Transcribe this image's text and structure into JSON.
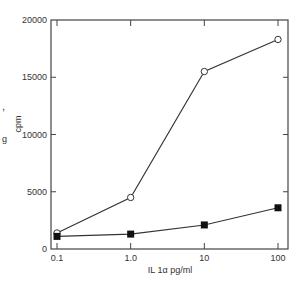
{
  "chart_data": {
    "type": "line",
    "title": "",
    "xlabel": "IL 1α pg/ml",
    "ylabel": "cpm",
    "x_scale": "log",
    "x": [
      0.1,
      1.0,
      10,
      100
    ],
    "x_tick_labels": [
      "0.1",
      "1.0",
      "10",
      "100"
    ],
    "y_ticks": [
      0,
      5000,
      10000,
      15000,
      20000
    ],
    "y_tick_labels": [
      "0",
      "5000",
      "10000",
      "15000",
      "20000"
    ],
    "ylim": [
      0,
      20000
    ],
    "grid": false,
    "legend": null,
    "series": [
      {
        "name": "open circles",
        "marker": "open-circle",
        "values": [
          1400,
          4500,
          15500,
          18300
        ]
      },
      {
        "name": "filled squares",
        "marker": "filled-square",
        "values": [
          1100,
          1300,
          2100,
          3600
        ]
      }
    ]
  },
  "edge_marks": [
    ",",
    "g"
  ]
}
